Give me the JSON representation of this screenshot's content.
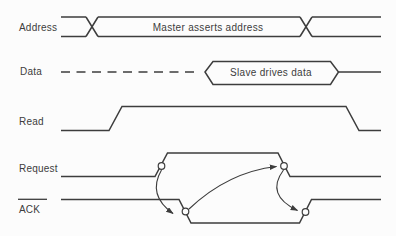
{
  "figure": {
    "name": "asynchronous-bus-handshake-timing-diagram",
    "paper_color": "#fcfcfc",
    "ink_color": "#3d3d3d"
  },
  "signals": {
    "address": {
      "label": "Address",
      "kind": "bus",
      "annotation": "Master asserts address"
    },
    "data": {
      "label": "Data",
      "kind": "bus",
      "annotation": "Slave drives data"
    },
    "read": {
      "label": "Read",
      "kind": "single-line"
    },
    "request": {
      "label": "Request",
      "kind": "single-line"
    },
    "ack": {
      "label": "ACK",
      "kind": "single-line",
      "active_low_overline": true
    }
  },
  "handshake": {
    "nodes": [
      "request-rise",
      "ack-fall",
      "request-fall",
      "ack-rise"
    ],
    "arrows": [
      {
        "from": "request-rise",
        "to": "ack-fall"
      },
      {
        "from": "ack-fall",
        "to": "request-fall"
      },
      {
        "from": "request-fall",
        "to": "ack-rise"
      }
    ]
  }
}
